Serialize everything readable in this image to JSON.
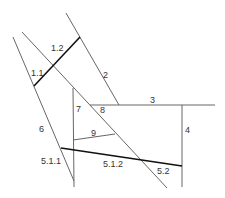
{
  "diagram": {
    "colors": {
      "thin": "#666666",
      "thick": "#111111",
      "background": "#ffffff"
    },
    "segments": [
      {
        "id": "6",
        "x1": 13,
        "y1": 37,
        "x2": 74,
        "y2": 181,
        "weight": "thin"
      },
      {
        "id": "diagonal",
        "x1": 22,
        "y1": 32,
        "x2": 167,
        "y2": 188,
        "weight": "thin"
      },
      {
        "id": "2",
        "x1": 66,
        "y1": 13,
        "x2": 119,
        "y2": 105,
        "weight": "thin"
      },
      {
        "id": "1.1-1.2",
        "x1": 34,
        "y1": 86,
        "x2": 80,
        "y2": 37,
        "weight": "thick"
      },
      {
        "id": "3",
        "x1": 90,
        "y1": 105,
        "x2": 215,
        "y2": 105,
        "weight": "thin"
      },
      {
        "id": "4",
        "x1": 182,
        "y1": 105,
        "x2": 182,
        "y2": 187,
        "weight": "thin"
      },
      {
        "id": "7",
        "x1": 73,
        "y1": 88,
        "x2": 74,
        "y2": 187,
        "weight": "thin"
      },
      {
        "id": "9",
        "x1": 73,
        "y1": 140,
        "x2": 115,
        "y2": 134,
        "weight": "thin"
      },
      {
        "id": "5.1-5.2",
        "x1": 61,
        "y1": 148,
        "x2": 182,
        "y2": 166,
        "weight": "thick"
      }
    ],
    "labels": [
      {
        "text": "1.2",
        "x": 51,
        "y": 51
      },
      {
        "text": "1.1",
        "x": 31,
        "y": 76
      },
      {
        "text": "2",
        "x": 103,
        "y": 78
      },
      {
        "text": "3",
        "x": 150,
        "y": 103
      },
      {
        "text": "7",
        "x": 76,
        "y": 112
      },
      {
        "text": "8",
        "x": 100,
        "y": 113
      },
      {
        "text": "4",
        "x": 185,
        "y": 133
      },
      {
        "text": "6",
        "x": 39,
        "y": 132
      },
      {
        "text": "9",
        "x": 91,
        "y": 136
      },
      {
        "text": "5.1.1",
        "x": 41,
        "y": 164
      },
      {
        "text": "5.1.2",
        "x": 103,
        "y": 167
      },
      {
        "text": "5.2",
        "x": 157,
        "y": 174
      }
    ]
  }
}
